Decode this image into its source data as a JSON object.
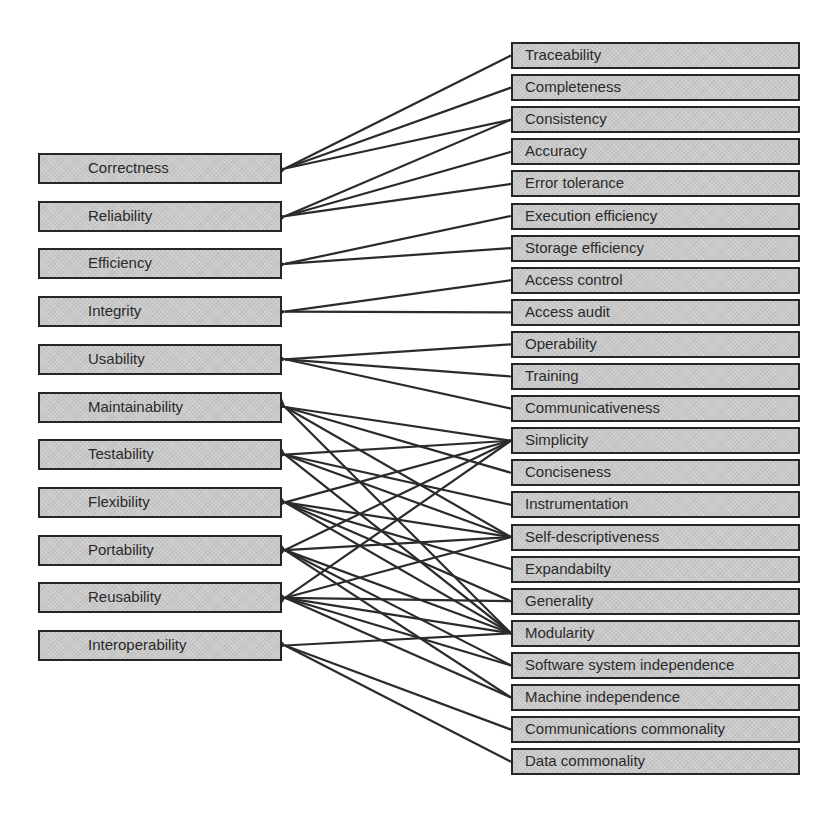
{
  "diagram": {
    "type": "McCall software quality model (factors and criteria)",
    "colors": {
      "box_fill": "#c9c9c9",
      "box_border": "#262626",
      "arrow": "#2b2b2b",
      "text": "#2a2a2a",
      "background": "#ffffff"
    },
    "factors": [
      {
        "label": "Correctness"
      },
      {
        "label": "Reliability"
      },
      {
        "label": "Efficiency"
      },
      {
        "label": "Integrity"
      },
      {
        "label": "Usability"
      },
      {
        "label": "Maintainability"
      },
      {
        "label": "Testability"
      },
      {
        "label": "Flexibility"
      },
      {
        "label": "Portability"
      },
      {
        "label": "Reusability"
      },
      {
        "label": "Interoperability"
      }
    ],
    "criteria": [
      {
        "label": "Traceability"
      },
      {
        "label": "Completeness"
      },
      {
        "label": "Consistency"
      },
      {
        "label": "Accuracy"
      },
      {
        "label": "Error tolerance"
      },
      {
        "label": "Execution efficiency"
      },
      {
        "label": "Storage efficiency"
      },
      {
        "label": "Access control"
      },
      {
        "label": "Access audit"
      },
      {
        "label": "Operability"
      },
      {
        "label": "Training"
      },
      {
        "label": "Communicativeness"
      },
      {
        "label": "Simplicity"
      },
      {
        "label": "Conciseness"
      },
      {
        "label": "Instrumentation"
      },
      {
        "label": "Self-descriptiveness"
      },
      {
        "label": "Expandabilty"
      },
      {
        "label": "Generality"
      },
      {
        "label": "Modularity"
      },
      {
        "label": "Software system independence"
      },
      {
        "label": "Machine independence"
      },
      {
        "label": "Communications commonality"
      },
      {
        "label": "Data commonality"
      }
    ],
    "links": [
      {
        "from": "Traceability",
        "to": "Correctness"
      },
      {
        "from": "Completeness",
        "to": "Correctness"
      },
      {
        "from": "Consistency",
        "to": "Correctness"
      },
      {
        "from": "Consistency",
        "to": "Reliability"
      },
      {
        "from": "Accuracy",
        "to": "Reliability"
      },
      {
        "from": "Error tolerance",
        "to": "Reliability"
      },
      {
        "from": "Execution efficiency",
        "to": "Efficiency"
      },
      {
        "from": "Storage efficiency",
        "to": "Efficiency"
      },
      {
        "from": "Access control",
        "to": "Integrity"
      },
      {
        "from": "Access audit",
        "to": "Integrity"
      },
      {
        "from": "Operability",
        "to": "Usability"
      },
      {
        "from": "Training",
        "to": "Usability"
      },
      {
        "from": "Communicativeness",
        "to": "Usability"
      },
      {
        "from": "Simplicity",
        "to": "Maintainability"
      },
      {
        "from": "Conciseness",
        "to": "Maintainability"
      },
      {
        "from": "Self-descriptiveness",
        "to": "Maintainability"
      },
      {
        "from": "Modularity",
        "to": "Maintainability"
      },
      {
        "from": "Simplicity",
        "to": "Testability"
      },
      {
        "from": "Instrumentation",
        "to": "Testability"
      },
      {
        "from": "Self-descriptiveness",
        "to": "Testability"
      },
      {
        "from": "Modularity",
        "to": "Testability"
      },
      {
        "from": "Simplicity",
        "to": "Flexibility"
      },
      {
        "from": "Self-descriptiveness",
        "to": "Flexibility"
      },
      {
        "from": "Expandabilty",
        "to": "Flexibility"
      },
      {
        "from": "Generality",
        "to": "Flexibility"
      },
      {
        "from": "Modularity",
        "to": "Flexibility"
      },
      {
        "from": "Simplicity",
        "to": "Portability"
      },
      {
        "from": "Self-descriptiveness",
        "to": "Portability"
      },
      {
        "from": "Modularity",
        "to": "Portability"
      },
      {
        "from": "Software system independence",
        "to": "Portability"
      },
      {
        "from": "Machine independence",
        "to": "Portability"
      },
      {
        "from": "Simplicity",
        "to": "Reusability"
      },
      {
        "from": "Self-descriptiveness",
        "to": "Reusability"
      },
      {
        "from": "Generality",
        "to": "Reusability"
      },
      {
        "from": "Modularity",
        "to": "Reusability"
      },
      {
        "from": "Software system independence",
        "to": "Reusability"
      },
      {
        "from": "Machine independence",
        "to": "Reusability"
      },
      {
        "from": "Modularity",
        "to": "Interoperability"
      },
      {
        "from": "Communications commonality",
        "to": "Interoperability"
      },
      {
        "from": "Data commonality",
        "to": "Interoperability"
      }
    ]
  }
}
